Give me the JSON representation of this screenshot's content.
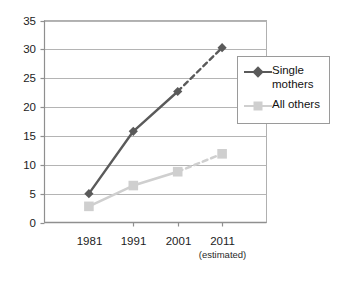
{
  "chart_data": {
    "type": "line",
    "title": "",
    "subtitle": "",
    "xlabel": "",
    "ylabel": "",
    "categories": [
      "1981",
      "1991",
      "2001",
      "2011"
    ],
    "category_sublabels": [
      "",
      "",
      "",
      "(estimated)"
    ],
    "ylim": [
      0,
      35
    ],
    "yticks": [
      0,
      5,
      10,
      15,
      20,
      25,
      30,
      35
    ],
    "ytick_labels": [
      "0",
      "5",
      "10",
      "15",
      "20",
      "25",
      "30",
      "35"
    ],
    "grid": "horizontal",
    "legend_position": "right-inside",
    "series": [
      {
        "name": "Single\nmothers",
        "legend_label": "Single\nmothers",
        "values": [
          5.0,
          15.8,
          22.7,
          30.3
        ],
        "color": "#5a5a5a",
        "marker": "diamond",
        "last_segment_style": "dashed"
      },
      {
        "name": "All others",
        "legend_label": "All others",
        "values": [
          2.8,
          6.4,
          8.8,
          11.9
        ],
        "color": "#cfcfcf",
        "marker": "square",
        "last_segment_style": "dashed"
      }
    ]
  },
  "legend": {
    "items": [
      {
        "label": "Single\nmothers",
        "marker": "diamond-marker",
        "color": "#5a5a5a"
      },
      {
        "label": "All others",
        "marker": "square-marker",
        "color": "#cfcfcf"
      }
    ]
  },
  "axes": {
    "y_tick_labels": [
      "35",
      "30",
      "25",
      "20",
      "15",
      "10",
      "5",
      "0"
    ],
    "x_tick_labels": [
      "1981",
      "1991",
      "2001",
      "2011"
    ],
    "x_tick_sublabels": [
      "",
      "",
      "",
      "(estimated)"
    ]
  },
  "colors": {
    "single_mothers": "#5a5a5a",
    "all_others": "#cfcfcf",
    "grid": "#b4b4b4",
    "axis": "#8f8f8f",
    "plot_border": "#b0b0b0",
    "text": "#1a1a1a",
    "background": "#ffffff"
  }
}
